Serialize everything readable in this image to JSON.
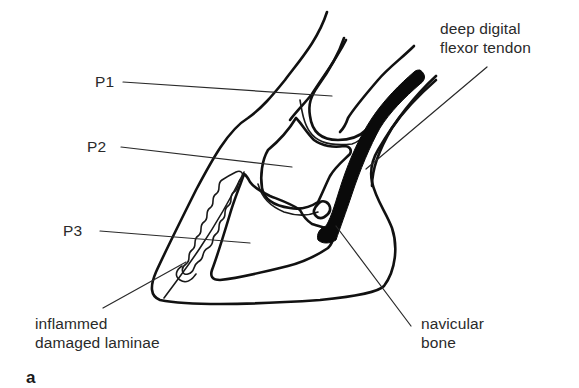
{
  "figure": {
    "panel_letter": "a",
    "labels": {
      "p1": "P1",
      "p2": "P2",
      "p3": "P3",
      "ddft_line1": "deep digital",
      "ddft_line2": "flexor tendon",
      "laminae_line1": "inflammed",
      "laminae_line2": "damaged laminae",
      "navicular_line1": "navicular",
      "navicular_line2": "bone"
    },
    "colors": {
      "ink": "#111111",
      "text": "#2a2a2a",
      "background": "#ffffff"
    }
  }
}
